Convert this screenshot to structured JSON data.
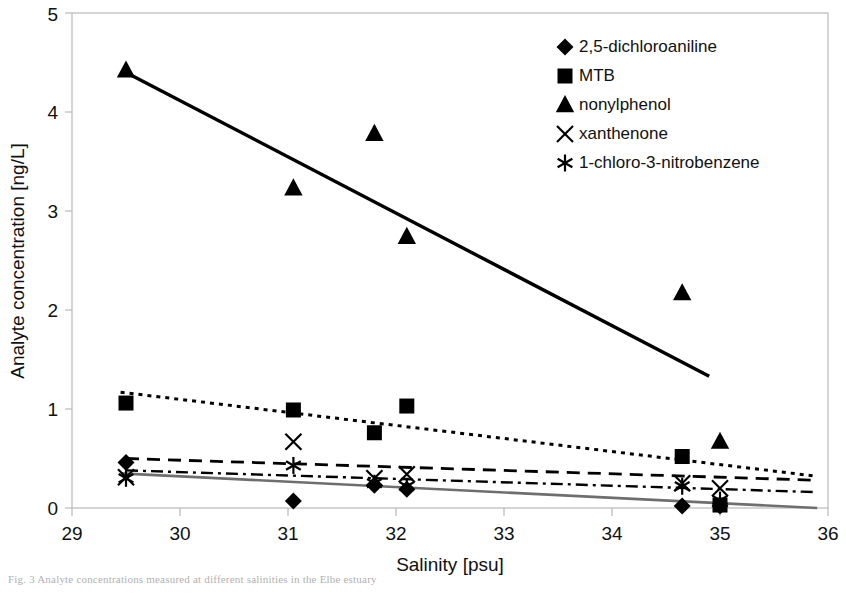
{
  "figure": {
    "caption": "Fig. 3 Analyte concentrations measured at different salinities in the Elbe estuary"
  },
  "chart_data": {
    "type": "scatter",
    "title": "",
    "xlabel": "Salinity [psu]",
    "ylabel": "Analyte concentration [ng/L]",
    "xlim": [
      29,
      36
    ],
    "ylim": [
      0,
      5
    ],
    "xticks": [
      29,
      30,
      31,
      32,
      33,
      34,
      35,
      36
    ],
    "yticks": [
      0,
      1,
      2,
      3,
      4,
      5
    ],
    "xtick_labels": [
      "29",
      "30",
      "31",
      "32",
      "33",
      "34",
      "35",
      "36"
    ],
    "ytick_labels": [
      "0",
      "1",
      "2",
      "3",
      "4",
      "5"
    ],
    "grid": false,
    "legend_position": "top-right",
    "series": [
      {
        "name": "2,5-dichloroaniline",
        "marker": "diamond",
        "color": "#000000",
        "line_style": "dashed",
        "points": [
          {
            "x": 29.5,
            "y": 0.46
          },
          {
            "x": 31.05,
            "y": 0.07
          },
          {
            "x": 31.8,
            "y": 0.23
          },
          {
            "x": 32.1,
            "y": 0.19
          },
          {
            "x": 34.65,
            "y": 0.02
          },
          {
            "x": 35.0,
            "y": 0.02
          }
        ],
        "trend_start": {
          "x": 29.5,
          "y": 0.5
        },
        "trend_end": {
          "x": 35.9,
          "y": 0.28
        }
      },
      {
        "name": "MTB",
        "marker": "square",
        "color": "#000000",
        "line_style": "dotted",
        "points": [
          {
            "x": 29.5,
            "y": 1.06
          },
          {
            "x": 31.05,
            "y": 0.99
          },
          {
            "x": 31.8,
            "y": 0.76
          },
          {
            "x": 32.1,
            "y": 1.03
          },
          {
            "x": 34.65,
            "y": 0.52
          },
          {
            "x": 35.0,
            "y": 0.03
          }
        ],
        "trend_start": {
          "x": 29.45,
          "y": 1.17
        },
        "trend_end": {
          "x": 35.9,
          "y": 0.32
        }
      },
      {
        "name": "nonylphenol",
        "marker": "triangle",
        "color": "#000000",
        "line_style": "solid",
        "points": [
          {
            "x": 29.5,
            "y": 4.42
          },
          {
            "x": 31.05,
            "y": 3.23
          },
          {
            "x": 31.8,
            "y": 3.78
          },
          {
            "x": 32.1,
            "y": 2.74
          },
          {
            "x": 34.65,
            "y": 2.17
          },
          {
            "x": 35.0,
            "y": 0.67
          }
        ],
        "trend_start": {
          "x": 29.5,
          "y": 4.4
        },
        "trend_end": {
          "x": 34.9,
          "y": 1.33
        }
      },
      {
        "name": "xanthenone",
        "marker": "x",
        "color": "#000000",
        "line_style": "dash-dot",
        "points": [
          {
            "x": 29.5,
            "y": 0.31
          },
          {
            "x": 31.05,
            "y": 0.67
          },
          {
            "x": 31.8,
            "y": 0.3
          },
          {
            "x": 32.1,
            "y": 0.34
          },
          {
            "x": 34.65,
            "y": 0.25
          },
          {
            "x": 35.0,
            "y": 0.2
          }
        ],
        "trend_start": {
          "x": 29.5,
          "y": 0.38
        },
        "trend_end": {
          "x": 35.9,
          "y": 0.16
        }
      },
      {
        "name": "1-chloro-3-nitrobenzene",
        "marker": "asterisk",
        "color": "#000000",
        "line_style": "solid-gray",
        "points": [
          {
            "x": 29.5,
            "y": 0.3
          },
          {
            "x": 31.05,
            "y": 0.43
          },
          {
            "x": 31.8,
            "y": 0.25
          },
          {
            "x": 32.1,
            "y": 0.22
          },
          {
            "x": 34.65,
            "y": 0.22
          },
          {
            "x": 35.0,
            "y": 0.08
          }
        ],
        "trend_start": {
          "x": 29.45,
          "y": 0.35
        },
        "trend_end": {
          "x": 35.9,
          "y": 0.0
        }
      }
    ]
  },
  "legend": {
    "items": [
      {
        "label": "2,5-dichloroaniline",
        "marker": "diamond"
      },
      {
        "label": "MTB",
        "marker": "square"
      },
      {
        "label": "nonylphenol",
        "marker": "triangle"
      },
      {
        "label": "xanthenone",
        "marker": "x"
      },
      {
        "label": "1-chloro-3-nitrobenzene",
        "marker": "asterisk"
      }
    ]
  }
}
